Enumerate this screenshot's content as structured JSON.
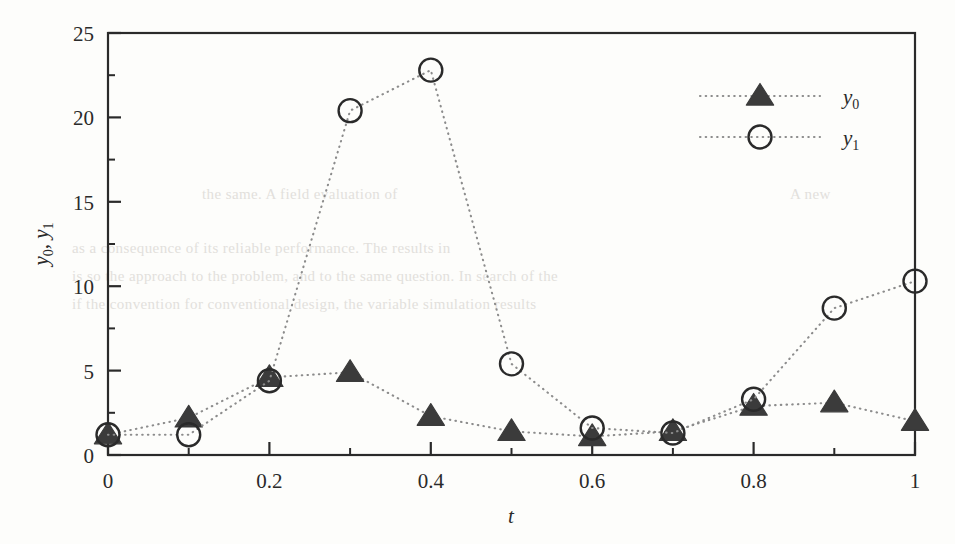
{
  "chart_data": {
    "type": "line",
    "title": "",
    "xlabel": "t",
    "ylabel": "y0, y1",
    "xlim": [
      0,
      1
    ],
    "ylim": [
      0,
      25
    ],
    "grid": false,
    "legend_position": "top-right-inside",
    "x": [
      0,
      0.1,
      0.2,
      0.3,
      0.4,
      0.5,
      0.6,
      0.7,
      0.8,
      0.9,
      1
    ],
    "xticks": [
      0,
      0.2,
      0.4,
      0.6,
      0.8,
      1
    ],
    "xticklabels": [
      "0",
      "0.2",
      "0.4",
      "0.6",
      "0.8",
      "1"
    ],
    "xminorticks": [
      0.1,
      0.3,
      0.5,
      0.7,
      0.9
    ],
    "yticks": [
      0,
      5,
      10,
      15,
      20,
      25
    ],
    "yticklabels": [
      "0",
      "5",
      "10",
      "15",
      "20",
      "25"
    ],
    "yminorticks": [
      2.5,
      7.5,
      12.5,
      17.5,
      22.5
    ],
    "series": [
      {
        "name": "y0",
        "marker": "filled-triangle",
        "linestyle": "dotted",
        "color": "#3b3b3b",
        "values": [
          1.2,
          2.2,
          4.6,
          4.9,
          2.3,
          1.4,
          1.1,
          1.4,
          2.9,
          3.1,
          2.0
        ]
      },
      {
        "name": "y1",
        "marker": "open-circle",
        "linestyle": "dotted",
        "color": "#2a2a2a",
        "values": [
          1.2,
          1.2,
          4.4,
          20.4,
          22.8,
          5.4,
          1.6,
          1.3,
          3.3,
          8.7,
          10.3
        ]
      }
    ]
  },
  "legend": {
    "entries": [
      {
        "label_base": "y",
        "label_sub": "0",
        "marker": "filled-triangle"
      },
      {
        "label_base": "y",
        "label_sub": "1",
        "marker": "open-circle"
      }
    ]
  },
  "axes": {
    "x_axis_label_base": "t",
    "y_axis_label_parts": [
      "y",
      "0",
      ", ",
      "y",
      "1"
    ]
  },
  "colors": {
    "background": "#fdfdfb",
    "axis": "#2a2a2a",
    "marker_fill": "#3b3b3b",
    "dotted_line": "#8c8c8c",
    "bleed_text": "#e2e0dc"
  },
  "bleed_text": {
    "lines": [
      "the same. A field evaluation of",
      "A new",
      "as a consequence of its reliable performance.  The results in",
      "is so the approach to the problem, and to the same question.  In search of the",
      "if the convention for conventional design, the variable simulation results"
    ]
  }
}
